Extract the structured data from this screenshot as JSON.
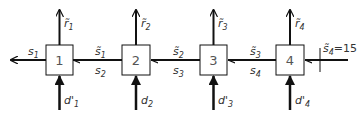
{
  "diagram": {
    "type": "serial reservoir / flow network",
    "nodes": [
      {
        "id": "1",
        "label": "1",
        "release": "r̃",
        "release_sub": "1",
        "demand": "d'",
        "demand_sub": "1"
      },
      {
        "id": "2",
        "label": "2",
        "release": "r̃",
        "release_sub": "2",
        "demand": "d",
        "demand_sub": "2"
      },
      {
        "id": "3",
        "label": "3",
        "release": "r̃",
        "release_sub": "3",
        "demand": "d'",
        "demand_sub": "3"
      },
      {
        "id": "4",
        "label": "4",
        "release": "r̃",
        "release_sub": "4",
        "demand": "d'",
        "demand_sub": "4"
      }
    ],
    "links": [
      {
        "from": "1",
        "to": "out",
        "top": "s",
        "top_sub": "1",
        "bottom": "",
        "bottom_sub": ""
      },
      {
        "from": "2",
        "to": "1",
        "top": "s̃",
        "top_sub": "1",
        "bottom": "s",
        "bottom_sub": "2"
      },
      {
        "from": "3",
        "to": "2",
        "top": "s̃",
        "top_sub": "2",
        "bottom": "s",
        "bottom_sub": "3"
      },
      {
        "from": "4",
        "to": "3",
        "top": "s̃",
        "top_sub": "3",
        "bottom": "s",
        "bottom_sub": "4"
      }
    ],
    "boundary": {
      "symbol": "s̃",
      "sub": "4",
      "value": "=15"
    }
  }
}
